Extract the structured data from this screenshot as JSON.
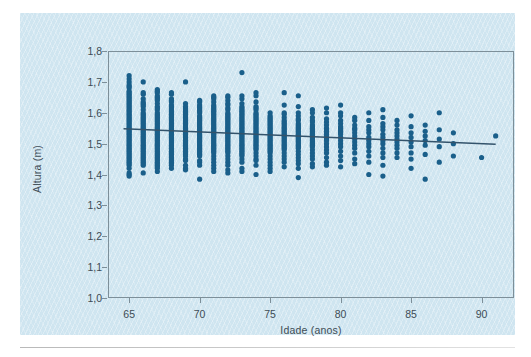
{
  "figure": {
    "panel_color": "#cfe5f0",
    "frame_color": "#7d8f99",
    "tick_label_color": "#3d4c55"
  },
  "chart_data": {
    "type": "scatter",
    "title": "",
    "xlabel": "Idade (anos)",
    "ylabel": "Altura (m)",
    "xlim": [
      63.5,
      92.3
    ],
    "ylim": [
      1.0,
      1.8
    ],
    "grid": false,
    "legend": null,
    "marker_color": "#1a5f8a",
    "marker_size_px": 5.2,
    "xticks": [
      65,
      70,
      75,
      80,
      85,
      90
    ],
    "xtick_labels": [
      "65",
      "70",
      "75",
      "80",
      "85",
      "90"
    ],
    "yticks": [
      1.0,
      1.1,
      1.2,
      1.3,
      1.4,
      1.5,
      1.6,
      1.7,
      1.8
    ],
    "ytick_labels": [
      "1,0",
      "1,1",
      "1,2",
      "1,3",
      "1,4",
      "1,5",
      "1,6",
      "1,7",
      "1,8"
    ],
    "trendline": {
      "color": "#33536b",
      "width_px": 1.4,
      "x": [
        64.6,
        91.0
      ],
      "y": [
        1.548,
        1.498
      ]
    },
    "columns": [
      {
        "x": 65.0,
        "y": [
          1.72,
          1.71,
          1.7,
          1.69,
          1.685,
          1.68,
          1.67,
          1.665,
          1.66,
          1.655,
          1.65,
          1.645,
          1.64,
          1.635,
          1.63,
          1.625,
          1.62,
          1.615,
          1.61,
          1.605,
          1.6,
          1.595,
          1.59,
          1.585,
          1.58,
          1.575,
          1.57,
          1.565,
          1.56,
          1.555,
          1.55,
          1.545,
          1.54,
          1.535,
          1.53,
          1.525,
          1.52,
          1.515,
          1.51,
          1.505,
          1.5,
          1.495,
          1.49,
          1.485,
          1.48,
          1.475,
          1.47,
          1.465,
          1.46,
          1.455,
          1.45,
          1.445,
          1.44,
          1.435,
          1.43,
          1.42,
          1.405,
          1.4,
          1.395
        ]
      },
      {
        "x": 66.0,
        "y": [
          1.7,
          1.665,
          1.66,
          1.645,
          1.635,
          1.63,
          1.625,
          1.62,
          1.61,
          1.6,
          1.595,
          1.59,
          1.585,
          1.58,
          1.575,
          1.57,
          1.565,
          1.56,
          1.555,
          1.55,
          1.545,
          1.54,
          1.535,
          1.53,
          1.525,
          1.52,
          1.515,
          1.51,
          1.505,
          1.5,
          1.495,
          1.49,
          1.485,
          1.48,
          1.475,
          1.47,
          1.465,
          1.46,
          1.455,
          1.45,
          1.445,
          1.44,
          1.435,
          1.43,
          1.405
        ]
      },
      {
        "x": 67.0,
        "y": [
          1.675,
          1.67,
          1.665,
          1.655,
          1.65,
          1.645,
          1.64,
          1.63,
          1.62,
          1.615,
          1.61,
          1.6,
          1.595,
          1.59,
          1.585,
          1.58,
          1.575,
          1.57,
          1.565,
          1.56,
          1.555,
          1.55,
          1.545,
          1.54,
          1.535,
          1.53,
          1.525,
          1.52,
          1.515,
          1.51,
          1.505,
          1.5,
          1.495,
          1.49,
          1.485,
          1.48,
          1.475,
          1.47,
          1.465,
          1.46,
          1.455,
          1.45,
          1.445,
          1.44,
          1.435,
          1.43,
          1.425,
          1.42,
          1.41
        ]
      },
      {
        "x": 68.0,
        "y": [
          1.665,
          1.66,
          1.645,
          1.64,
          1.635,
          1.625,
          1.62,
          1.615,
          1.61,
          1.605,
          1.6,
          1.595,
          1.59,
          1.585,
          1.58,
          1.575,
          1.57,
          1.565,
          1.56,
          1.555,
          1.55,
          1.545,
          1.54,
          1.535,
          1.53,
          1.525,
          1.52,
          1.515,
          1.51,
          1.505,
          1.5,
          1.495,
          1.49,
          1.485,
          1.48,
          1.475,
          1.47,
          1.465,
          1.46,
          1.455,
          1.45,
          1.445,
          1.44,
          1.435,
          1.43,
          1.42
        ]
      },
      {
        "x": 69.0,
        "y": [
          1.7,
          1.63,
          1.62,
          1.615,
          1.61,
          1.605,
          1.6,
          1.595,
          1.59,
          1.585,
          1.58,
          1.575,
          1.57,
          1.565,
          1.56,
          1.555,
          1.55,
          1.545,
          1.54,
          1.535,
          1.53,
          1.525,
          1.52,
          1.515,
          1.51,
          1.505,
          1.5,
          1.495,
          1.49,
          1.485,
          1.48,
          1.475,
          1.47,
          1.465,
          1.46,
          1.45,
          1.445,
          1.43,
          1.42,
          1.415
        ]
      },
      {
        "x": 70.0,
        "y": [
          1.64,
          1.635,
          1.625,
          1.62,
          1.615,
          1.61,
          1.605,
          1.6,
          1.59,
          1.585,
          1.58,
          1.575,
          1.57,
          1.565,
          1.56,
          1.555,
          1.55,
          1.545,
          1.54,
          1.535,
          1.53,
          1.525,
          1.52,
          1.515,
          1.51,
          1.505,
          1.5,
          1.495,
          1.49,
          1.485,
          1.48,
          1.475,
          1.47,
          1.465,
          1.46,
          1.445,
          1.44,
          1.43,
          1.385
        ]
      },
      {
        "x": 71.0,
        "y": [
          1.655,
          1.65,
          1.645,
          1.635,
          1.625,
          1.62,
          1.615,
          1.61,
          1.605,
          1.6,
          1.595,
          1.59,
          1.585,
          1.58,
          1.575,
          1.57,
          1.565,
          1.56,
          1.555,
          1.55,
          1.545,
          1.54,
          1.535,
          1.53,
          1.525,
          1.52,
          1.515,
          1.51,
          1.505,
          1.5,
          1.495,
          1.49,
          1.485,
          1.48,
          1.475,
          1.47,
          1.46,
          1.45,
          1.44,
          1.43,
          1.42,
          1.41
        ]
      },
      {
        "x": 72.0,
        "y": [
          1.655,
          1.65,
          1.64,
          1.63,
          1.625,
          1.615,
          1.61,
          1.6,
          1.595,
          1.59,
          1.585,
          1.58,
          1.575,
          1.57,
          1.565,
          1.56,
          1.555,
          1.55,
          1.545,
          1.54,
          1.535,
          1.53,
          1.525,
          1.52,
          1.515,
          1.51,
          1.505,
          1.5,
          1.495,
          1.49,
          1.485,
          1.48,
          1.475,
          1.47,
          1.46,
          1.45,
          1.44,
          1.43,
          1.415,
          1.405
        ]
      },
      {
        "x": 73.0,
        "y": [
          1.73,
          1.655,
          1.645,
          1.63,
          1.62,
          1.615,
          1.61,
          1.605,
          1.6,
          1.595,
          1.59,
          1.585,
          1.58,
          1.575,
          1.57,
          1.565,
          1.56,
          1.555,
          1.55,
          1.545,
          1.54,
          1.535,
          1.53,
          1.525,
          1.52,
          1.515,
          1.51,
          1.505,
          1.5,
          1.495,
          1.49,
          1.485,
          1.48,
          1.475,
          1.47,
          1.465,
          1.46,
          1.45,
          1.44,
          1.42,
          1.41
        ]
      },
      {
        "x": 74.0,
        "y": [
          1.665,
          1.655,
          1.635,
          1.62,
          1.615,
          1.61,
          1.6,
          1.595,
          1.59,
          1.585,
          1.58,
          1.575,
          1.57,
          1.565,
          1.56,
          1.555,
          1.55,
          1.545,
          1.54,
          1.535,
          1.53,
          1.525,
          1.52,
          1.515,
          1.51,
          1.505,
          1.5,
          1.495,
          1.49,
          1.485,
          1.48,
          1.47,
          1.46,
          1.45,
          1.445,
          1.43,
          1.4
        ]
      },
      {
        "x": 75.0,
        "y": [
          1.6,
          1.59,
          1.585,
          1.58,
          1.575,
          1.57,
          1.565,
          1.56,
          1.555,
          1.55,
          1.545,
          1.54,
          1.535,
          1.53,
          1.525,
          1.52,
          1.515,
          1.51,
          1.505,
          1.5,
          1.495,
          1.49,
          1.485,
          1.48,
          1.475,
          1.47,
          1.46,
          1.45,
          1.44,
          1.43,
          1.42,
          1.41
        ]
      },
      {
        "x": 76.0,
        "y": [
          1.665,
          1.625,
          1.6,
          1.595,
          1.585,
          1.575,
          1.57,
          1.565,
          1.56,
          1.555,
          1.55,
          1.545,
          1.54,
          1.535,
          1.53,
          1.525,
          1.52,
          1.515,
          1.51,
          1.505,
          1.5,
          1.495,
          1.49,
          1.485,
          1.48,
          1.47,
          1.46,
          1.45,
          1.44,
          1.425
        ]
      },
      {
        "x": 77.0,
        "y": [
          1.655,
          1.62,
          1.6,
          1.59,
          1.58,
          1.575,
          1.565,
          1.56,
          1.555,
          1.55,
          1.545,
          1.54,
          1.535,
          1.53,
          1.525,
          1.52,
          1.515,
          1.51,
          1.505,
          1.5,
          1.495,
          1.49,
          1.485,
          1.475,
          1.465,
          1.455,
          1.445,
          1.435,
          1.42,
          1.39
        ]
      },
      {
        "x": 78.0,
        "y": [
          1.61,
          1.6,
          1.585,
          1.575,
          1.57,
          1.56,
          1.555,
          1.55,
          1.545,
          1.54,
          1.535,
          1.53,
          1.525,
          1.52,
          1.515,
          1.51,
          1.505,
          1.5,
          1.495,
          1.49,
          1.48,
          1.47,
          1.46,
          1.45,
          1.435,
          1.425
        ]
      },
      {
        "x": 79.0,
        "y": [
          1.615,
          1.6,
          1.58,
          1.57,
          1.56,
          1.55,
          1.545,
          1.54,
          1.535,
          1.53,
          1.525,
          1.52,
          1.515,
          1.51,
          1.5,
          1.49,
          1.48,
          1.47,
          1.455,
          1.44,
          1.43
        ]
      },
      {
        "x": 80.0,
        "y": [
          1.625,
          1.6,
          1.59,
          1.575,
          1.565,
          1.555,
          1.55,
          1.545,
          1.54,
          1.535,
          1.53,
          1.52,
          1.51,
          1.5,
          1.49,
          1.475,
          1.46,
          1.445,
          1.425
        ]
      },
      {
        "x": 81.0,
        "y": [
          1.585,
          1.575,
          1.56,
          1.55,
          1.545,
          1.535,
          1.525,
          1.515,
          1.505,
          1.495,
          1.485,
          1.47,
          1.45,
          1.435
        ]
      },
      {
        "x": 82.0,
        "y": [
          1.6,
          1.575,
          1.555,
          1.545,
          1.535,
          1.52,
          1.51,
          1.5,
          1.49,
          1.475,
          1.46,
          1.44,
          1.4
        ]
      },
      {
        "x": 83.0,
        "y": [
          1.61,
          1.585,
          1.565,
          1.555,
          1.545,
          1.53,
          1.52,
          1.51,
          1.5,
          1.485,
          1.47,
          1.455,
          1.43,
          1.395
        ]
      },
      {
        "x": 84.0,
        "y": [
          1.575,
          1.56,
          1.545,
          1.535,
          1.525,
          1.515,
          1.505,
          1.495,
          1.485,
          1.47,
          1.455
        ]
      },
      {
        "x": 85.0,
        "y": [
          1.59,
          1.555,
          1.535,
          1.52,
          1.505,
          1.49,
          1.47,
          1.45,
          1.42
        ]
      },
      {
        "x": 86.0,
        "y": [
          1.56,
          1.54,
          1.525,
          1.51,
          1.495,
          1.465,
          1.385
        ]
      },
      {
        "x": 87.0,
        "y": [
          1.6,
          1.545,
          1.515,
          1.49,
          1.44
        ]
      },
      {
        "x": 88.0,
        "y": [
          1.535,
          1.5,
          1.46
        ]
      },
      {
        "x": 90.0,
        "y": [
          1.455
        ]
      },
      {
        "x": 91.0,
        "y": [
          1.525
        ]
      }
    ]
  }
}
